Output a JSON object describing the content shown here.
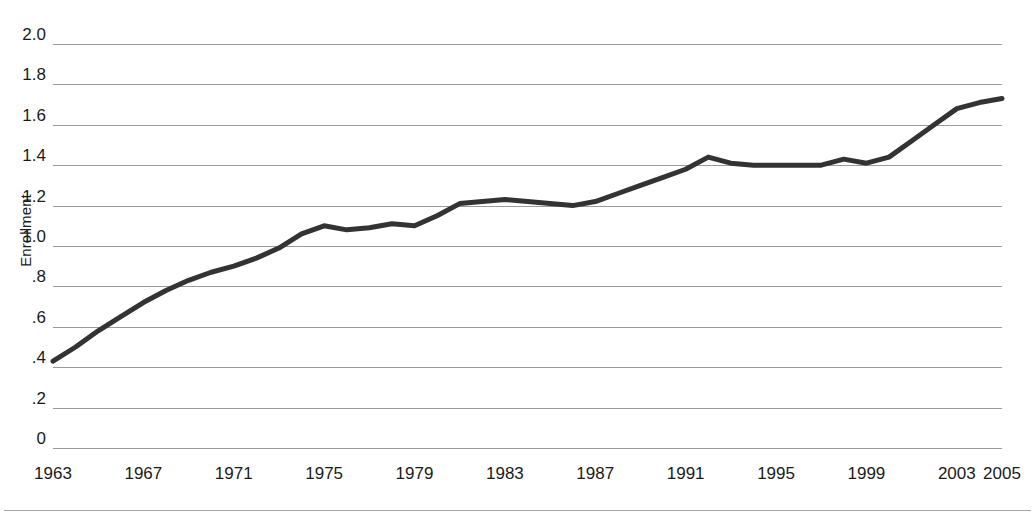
{
  "chart_data": {
    "type": "line",
    "title": "",
    "xlabel": "",
    "ylabel": "Enrollment",
    "ylim": [
      0,
      2.0
    ],
    "xlim": [
      1963,
      2005
    ],
    "grid": true,
    "legend": false,
    "line_color": "#333333",
    "gridline_color": "#9a9a9a",
    "y_ticks": [
      0,
      0.2,
      0.4,
      0.6,
      0.8,
      1.0,
      1.2,
      1.4,
      1.6,
      1.8,
      2.0
    ],
    "y_tick_labels": [
      "0",
      ".2",
      ".4",
      ".6",
      ".8",
      "1.0",
      "1.2",
      "1.4",
      "1.6",
      "1.8",
      "2.0"
    ],
    "x_ticks": [
      1963,
      1967,
      1971,
      1975,
      1979,
      1983,
      1987,
      1991,
      1995,
      1999,
      2003,
      2005
    ],
    "x_tick_labels": [
      "1963",
      "1967",
      "1971",
      "1975",
      "1979",
      "1983",
      "1987",
      "1991",
      "1995",
      "1999",
      "2003",
      "2005"
    ],
    "x": [
      1963,
      1964,
      1965,
      1966,
      1967,
      1968,
      1969,
      1970,
      1971,
      1972,
      1973,
      1974,
      1975,
      1976,
      1977,
      1978,
      1979,
      1980,
      1981,
      1982,
      1983,
      1984,
      1985,
      1986,
      1987,
      1988,
      1989,
      1990,
      1991,
      1992,
      1993,
      1994,
      1995,
      1996,
      1997,
      1998,
      1999,
      2000,
      2001,
      2002,
      2003,
      2004,
      2005
    ],
    "values": [
      0.43,
      0.5,
      0.58,
      0.65,
      0.72,
      0.78,
      0.83,
      0.87,
      0.9,
      0.94,
      0.99,
      1.06,
      1.1,
      1.08,
      1.09,
      1.11,
      1.1,
      1.15,
      1.21,
      1.22,
      1.23,
      1.22,
      1.21,
      1.2,
      1.22,
      1.26,
      1.3,
      1.34,
      1.38,
      1.44,
      1.41,
      1.4,
      1.4,
      1.4,
      1.4,
      1.43,
      1.41,
      1.44,
      1.52,
      1.6,
      1.68,
      1.71,
      1.73
    ],
    "series": [
      {
        "name": "Enrollment",
        "values": [
          0.43,
          0.5,
          0.58,
          0.65,
          0.72,
          0.78,
          0.83,
          0.87,
          0.9,
          0.94,
          0.99,
          1.06,
          1.1,
          1.08,
          1.09,
          1.11,
          1.1,
          1.15,
          1.21,
          1.22,
          1.23,
          1.22,
          1.21,
          1.2,
          1.22,
          1.26,
          1.3,
          1.34,
          1.38,
          1.44,
          1.41,
          1.4,
          1.4,
          1.4,
          1.4,
          1.43,
          1.41,
          1.44,
          1.52,
          1.6,
          1.68,
          1.71,
          1.73
        ]
      }
    ]
  }
}
